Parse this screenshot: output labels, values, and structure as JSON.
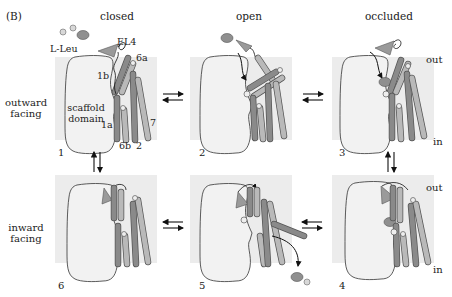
{
  "figure": {
    "panel_label": "(B)",
    "column_titles": [
      "closed",
      "open",
      "occluded"
    ],
    "row_labels": [
      {
        "line1": "outward",
        "line2": "facing"
      },
      {
        "line1": "inward",
        "line2": "facing"
      }
    ],
    "side_labels": {
      "out": "out",
      "in": "in"
    },
    "state_numbers": [
      "1",
      "2",
      "3",
      "4",
      "5",
      "6"
    ],
    "panel1_annotations": {
      "substrate": "L-Leu",
      "loop": "EL4",
      "helix_6a": "6a",
      "helix_1b": "1b",
      "helix_1a": "1a",
      "helix_6b": "6b",
      "helix_2": "2",
      "helix_7": "7",
      "scaffold_line1": "scaffold",
      "scaffold_line2": "domain"
    },
    "colors": {
      "membrane": "#ececec",
      "scaffold_fill": "#f2f2f2",
      "helix_dark": "#8a8a8a",
      "helix_light": "#b9b9b9",
      "substrate": "#8f8f8f",
      "ion": "#cfcfcf",
      "outline": "#333333"
    }
  }
}
